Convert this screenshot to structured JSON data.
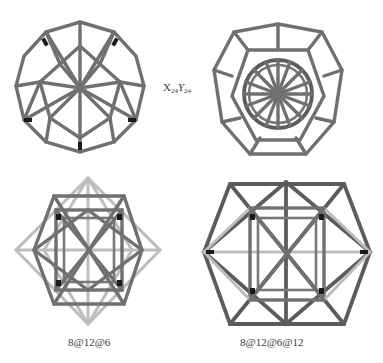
{
  "figures": [
    {
      "id": "top-left",
      "type": "polyhedral-framework",
      "description": "pentagonal/decagonal outline framework with 10-fold star center"
    },
    {
      "id": "top-right",
      "type": "polyhedral-framework",
      "description": "dodecahedron cage enclosing inner decagonal spoked wheel"
    },
    {
      "id": "bottom-left",
      "type": "polyhedral-framework",
      "description": "cube inside octahedron with cuboctahedral struts"
    },
    {
      "id": "bottom-right",
      "type": "polyhedral-framework",
      "description": "large cuboctahedron enclosing cube-octahedron compound"
    }
  ],
  "labels": {
    "top": {
      "main": "X",
      "sub1": "24",
      "mid": "Y",
      "sub2": "24"
    },
    "bottom_left": "8@12@6",
    "bottom_right": "8@12@6@12"
  },
  "colors": {
    "strut": "#707070",
    "strut_dark": "#5c5c5c",
    "strut_light": "#bdbdbd",
    "joint": "#1a1a1a",
    "background": "#ffffff",
    "text": "#3a3a3a"
  }
}
